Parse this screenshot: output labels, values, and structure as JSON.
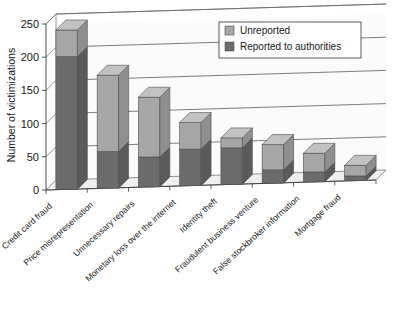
{
  "chart_data": {
    "type": "bar",
    "subtype": "stacked-3d-column",
    "title": "",
    "xlabel": "",
    "ylabel": "Number of victimizations",
    "ylim": [
      0,
      250
    ],
    "yticks": [
      0,
      50,
      100,
      150,
      200,
      250
    ],
    "ytick_labels": [
      "0",
      "50",
      "100",
      "150",
      "200",
      "250"
    ],
    "grid": "horizontal",
    "legend_position": "top-right",
    "categories": [
      "Credit card fraud",
      "Price misrepresentation",
      "Unnecessary repairs",
      "Monetary loss over the internet",
      "Identity theft",
      "Fraudulent business venture",
      "False stockbroker information",
      "Mortgage fraud"
    ],
    "series": [
      {
        "name": "Reported to authorities",
        "color": "#6b6b6b",
        "values": [
          200,
          55,
          45,
          55,
          55,
          20,
          15,
          7
        ]
      },
      {
        "name": "Unreported",
        "color": "#a6a6a6",
        "values": [
          40,
          115,
          90,
          40,
          15,
          38,
          28,
          16
        ]
      }
    ],
    "totals": [
      240,
      170,
      135,
      95,
      70,
      58,
      43,
      23
    ]
  },
  "legend": {
    "entries": [
      {
        "label": "Unreported",
        "color": "#a6a6a6"
      },
      {
        "label": "Reported to authorities",
        "color": "#6b6b6b"
      }
    ]
  },
  "axis": {
    "y_title": "Number of victimizations",
    "y_ticks": [
      "250",
      "200",
      "150",
      "100",
      "50",
      "0"
    ]
  },
  "colors": {
    "unreported_front": "#a6a6a6",
    "unreported_top": "#c2c2c2",
    "unreported_side": "#8f8f8f",
    "reported_front": "#6b6b6b",
    "reported_side": "#5a5a5a",
    "plot_background": "#fbfbfb",
    "floor": "#efefef",
    "gridline": "#5e5e5e",
    "axis_line": "#3a3a3a",
    "legend_border": "#4a4a4a",
    "legend_background": "#ffffff"
  }
}
